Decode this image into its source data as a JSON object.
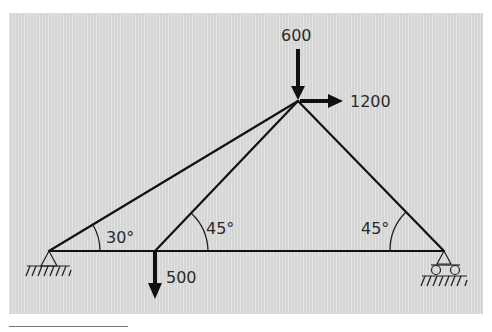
{
  "figure": {
    "type": "truss",
    "background_color": "#dcdcdc",
    "member_color": "#111111",
    "nodes": [
      {
        "id": "A",
        "role": "pin-support",
        "x": 49,
        "y": 251
      },
      {
        "id": "B",
        "role": "joint",
        "x": 155,
        "y": 251
      },
      {
        "id": "C",
        "role": "apex",
        "x": 298,
        "y": 101
      },
      {
        "id": "D",
        "role": "roller-support",
        "x": 444,
        "y": 251
      }
    ],
    "members": [
      {
        "from": "A",
        "to": "B"
      },
      {
        "from": "B",
        "to": "D"
      },
      {
        "from": "A",
        "to": "C"
      },
      {
        "from": "B",
        "to": "C"
      },
      {
        "from": "C",
        "to": "D"
      }
    ],
    "loads": [
      {
        "node": "C",
        "direction": "down",
        "value": "600"
      },
      {
        "node": "C",
        "direction": "right",
        "value": "1200"
      },
      {
        "node": "B",
        "direction": "down",
        "value": "500"
      }
    ],
    "angles": [
      {
        "at": "A",
        "label": "30°"
      },
      {
        "at": "B",
        "label": "45°"
      },
      {
        "at": "D",
        "label": "45°"
      }
    ]
  },
  "labels": {
    "load_600": "600",
    "load_1200": "1200",
    "load_500": "500",
    "angle_a": "30°",
    "angle_b": "45°",
    "angle_d": "45°"
  }
}
